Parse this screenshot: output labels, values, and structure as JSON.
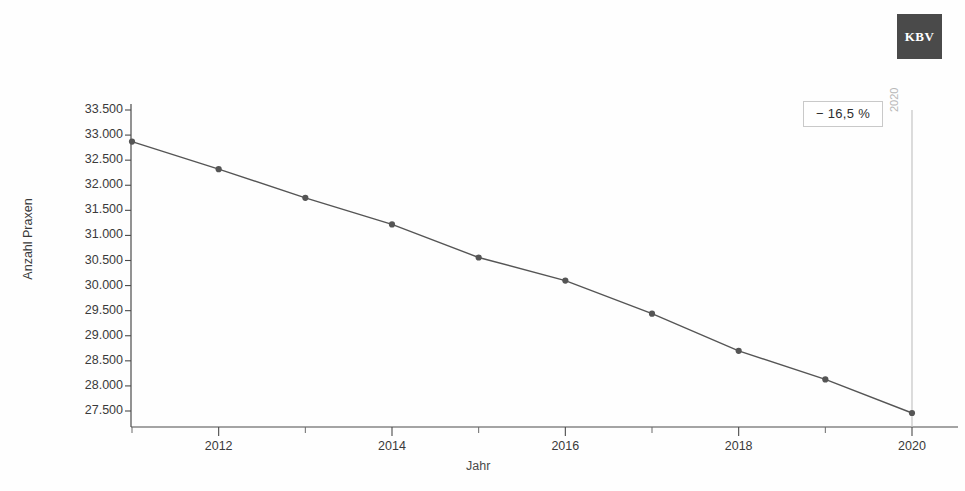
{
  "logo": {
    "text": "KBV",
    "color": "#4a4a4a"
  },
  "chart_data": {
    "type": "line",
    "title": "",
    "xlabel": "Jahr",
    "ylabel": "Anzahl Praxen",
    "x": [
      2011,
      2012,
      2013,
      2014,
      2015,
      2016,
      2017,
      2018,
      2019,
      2020
    ],
    "values": [
      32870,
      32320,
      31750,
      31220,
      30560,
      30100,
      29440,
      28700,
      28130,
      27460
    ],
    "series": [
      {
        "name": "Anzahl Praxen",
        "values": [
          32870,
          32320,
          31750,
          31220,
          30560,
          30100,
          29440,
          28700,
          28130,
          27460
        ]
      }
    ],
    "ylim": [
      27250,
      33600
    ],
    "xlim": [
      2010.85,
      2020.15
    ],
    "ytick_labels": [
      "33.500",
      "33.000",
      "32.500",
      "32.000",
      "31.500",
      "31.000",
      "30.500",
      "30.000",
      "29.500",
      "29.000",
      "28.500",
      "28.000",
      "27.500"
    ],
    "ytick_values": [
      33500,
      33000,
      32500,
      32000,
      31500,
      31000,
      30500,
      30000,
      29500,
      29000,
      28500,
      28000,
      27500
    ],
    "xtick_labels": [
      "2012",
      "2014",
      "2016",
      "2018",
      "2020"
    ],
    "xtick_values": [
      2012,
      2014,
      2016,
      2018,
      2020
    ],
    "xminor_ticks": [
      2011,
      2013,
      2015,
      2017,
      2019
    ],
    "grid": false,
    "legend": "none",
    "line_color": "#555555",
    "marker_color": "#555555",
    "annotations": [
      {
        "name": "change-badge",
        "text": "− 16,5 %"
      },
      {
        "name": "reference-line-label",
        "text": "2020",
        "x": 2020,
        "color": "#b8b8b8"
      }
    ]
  }
}
